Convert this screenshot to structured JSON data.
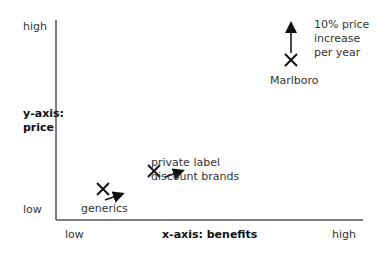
{
  "axes": {
    "y_high": "high",
    "y_title_line1": "y-axis:",
    "y_title_line2": "price",
    "y_low": "low",
    "x_low": "low",
    "x_title": "x-axis: benefits",
    "x_high": "high"
  },
  "points": [
    {
      "label": "generics",
      "arrow": "up-right"
    },
    {
      "label_line1": "private label",
      "label_line2": "discount brands",
      "arrow": "up-right"
    },
    {
      "label": "Marlboro",
      "arrow": "up",
      "note_line1": "10% price",
      "note_line2": "increase",
      "note_line3": "per year"
    }
  ],
  "colors": {
    "axis": "#555555",
    "marker": "#111111",
    "text": "#333333"
  }
}
